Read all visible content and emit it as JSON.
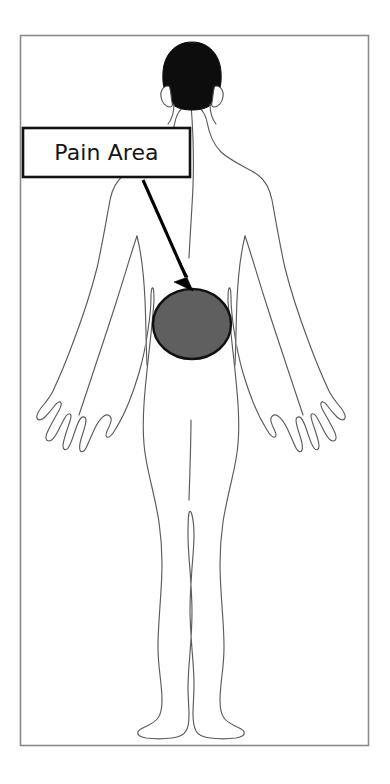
{
  "figure": {
    "view": "posterior human body outline, full figure, viewed from behind"
  },
  "frame": {
    "name": "image-border",
    "stroke_color": "#8a8a8a"
  },
  "callout": {
    "label": "Pain Area",
    "box_stroke_color": "#111111",
    "box_fill_color": "#ffffff",
    "text_color": "#151515"
  },
  "arrow": {
    "name": "callout-arrow",
    "color": "#000000",
    "points_to": "pain-area-marker"
  },
  "pain_marker": {
    "name": "pain-area-marker",
    "shape": "ellipse",
    "fill_color": "#5f5f5f",
    "stroke_color": "#111111",
    "region": "mid-back / lower back"
  },
  "body": {
    "outline_color": "#5b5b5b",
    "head_fill_color": "#0d0d0d",
    "fill_color": "#ffffff"
  }
}
